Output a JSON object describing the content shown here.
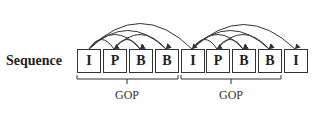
{
  "diagram": {
    "sequence_label": "Sequence",
    "frames": [
      "I",
      "P",
      "B",
      "B",
      "I",
      "P",
      "B",
      "B",
      "I"
    ],
    "groups": [
      {
        "label": "GOP",
        "start_frame": 0,
        "end_frame": 3
      },
      {
        "label": "GOP",
        "start_frame": 4,
        "end_frame": 7
      }
    ],
    "references": [
      {
        "from": 0,
        "to": 1
      },
      {
        "from": 0,
        "to": 2
      },
      {
        "from": 0,
        "to": 3
      },
      {
        "from": 1,
        "to": 2
      },
      {
        "from": 1,
        "to": 3
      },
      {
        "from": 0,
        "to": 4
      },
      {
        "from": 4,
        "to": 5
      },
      {
        "from": 4,
        "to": 6
      },
      {
        "from": 4,
        "to": 7
      },
      {
        "from": 5,
        "to": 6
      },
      {
        "from": 5,
        "to": 7
      },
      {
        "from": 4,
        "to": 8
      }
    ],
    "colors": {
      "line": "#333333",
      "background": "#ffffff"
    }
  }
}
